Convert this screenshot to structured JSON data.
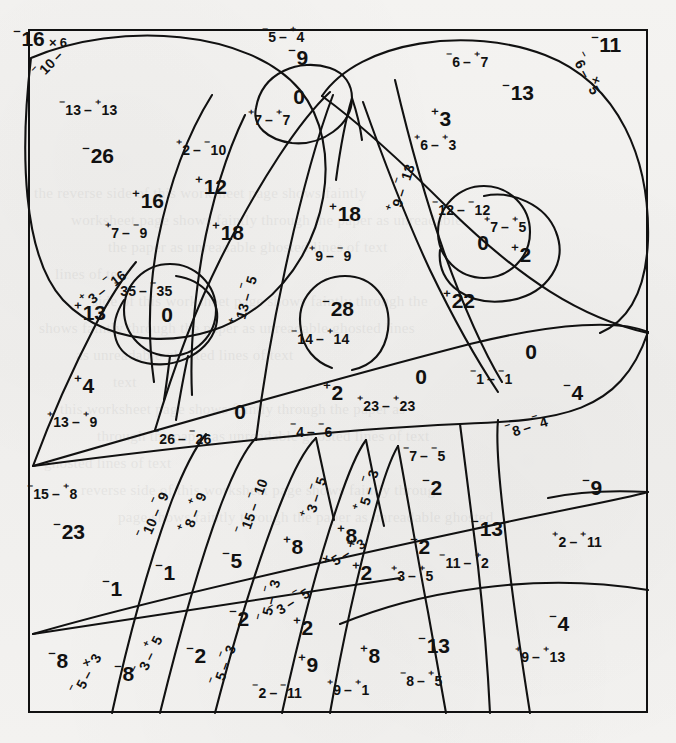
{
  "document": {
    "type": "integer-arithmetic-color-by-number-worksheet",
    "width": 676,
    "height": 743,
    "ink_color": "#111111",
    "paper_color": "#f2f1ef"
  },
  "notation": {
    "raised_minus": "⁻",
    "raised_plus": "⁺",
    "operator_subtract": "–",
    "operator_multiply": "×",
    "description": "Raised-sign integer notation: a small raised + or - precedes each numeral."
  },
  "regions": [
    {
      "id": "r01",
      "answer_sign": "-",
      "answer": "16",
      "answer_suffix": "× 6",
      "expr_a_sign": "-",
      "expr_a": "10",
      "op": "–",
      "expr_b_sign": "",
      "expr_b": "",
      "x": 40,
      "y": 38,
      "ex": 48,
      "ey": 62,
      "rot": -46
    },
    {
      "id": "r02",
      "answer_sign": "-",
      "answer": "26",
      "answer_suffix": "",
      "expr_a_sign": "-",
      "expr_a": "13",
      "op": "–",
      "expr_b_sign": "+",
      "expr_b": "13",
      "x": 98,
      "y": 155,
      "ex": 88,
      "ey": 108,
      "rot": 0
    },
    {
      "id": "r03",
      "answer_sign": "+",
      "answer": "16",
      "answer_suffix": "",
      "expr_a_sign": "+",
      "expr_a": "7",
      "op": "–",
      "expr_b_sign": "-",
      "expr_b": "9",
      "x": 148,
      "y": 200,
      "ex": 126,
      "ey": 231,
      "rot": 0
    },
    {
      "id": "r04",
      "answer_sign": "+",
      "answer": "12",
      "answer_suffix": "",
      "expr_a_sign": "+",
      "expr_a": "2",
      "op": "–",
      "expr_b_sign": "-",
      "expr_b": "10",
      "x": 211,
      "y": 186,
      "ex": 201,
      "ey": 148,
      "rot": 0
    },
    {
      "id": "r05",
      "answer_sign": "-",
      "answer": "9",
      "answer_suffix": "",
      "expr_a_sign": "-",
      "expr_a": "5",
      "op": "–",
      "expr_b_sign": "+",
      "expr_b": "4",
      "x": 298,
      "y": 57,
      "ex": 283,
      "ey": 35,
      "rot": 0
    },
    {
      "id": "r06",
      "answer_sign": "",
      "answer": "0",
      "answer_suffix": "",
      "expr_a_sign": "+",
      "expr_a": "7",
      "op": "–",
      "expr_b_sign": "+",
      "expr_b": "7",
      "x": 299,
      "y": 97,
      "ex": 269,
      "ey": 118,
      "rot": 0
    },
    {
      "id": "r07",
      "answer_sign": "-",
      "answer": "11",
      "answer_suffix": "",
      "expr_a_sign": "-",
      "expr_a": "6",
      "op": "–",
      "expr_b_sign": "×",
      "expr_b": "5",
      "x": 606,
      "y": 44,
      "ex": 588,
      "ey": 73,
      "rot": 62
    },
    {
      "id": "r08",
      "answer_sign": "-",
      "answer": "13",
      "answer_suffix": "",
      "expr_a_sign": "-",
      "expr_a": "6",
      "op": "–",
      "expr_b_sign": "+",
      "expr_b": "7",
      "x": 518,
      "y": 92,
      "ex": 467,
      "ey": 60,
      "rot": 0
    },
    {
      "id": "r09",
      "answer_sign": "+",
      "answer": "3",
      "answer_suffix": "",
      "expr_a_sign": "+",
      "expr_a": "6",
      "op": "–",
      "expr_b_sign": "+",
      "expr_b": "3",
      "x": 441,
      "y": 118,
      "ex": 435,
      "ey": 143,
      "rot": 0
    },
    {
      "id": "r10",
      "answer_sign": "+",
      "answer": "18",
      "answer_suffix": "",
      "expr_a_sign": "+",
      "expr_a": "9",
      "op": "–",
      "expr_b_sign": "-",
      "expr_b": "9",
      "x": 345,
      "y": 213,
      "ex": 330,
      "ey": 254,
      "rot": 0
    },
    {
      "id": "r11",
      "answer_sign": "+",
      "answer": "18",
      "answer_suffix": "",
      "expr_a_sign": "+",
      "expr_a": "13",
      "op": "–",
      "expr_b_sign": "-",
      "expr_b": "5",
      "x": 228,
      "y": 232,
      "ex": 243,
      "ey": 300,
      "rot": -74
    },
    {
      "id": "r12",
      "answer_sign": "",
      "answer": "0",
      "answer_suffix": "",
      "expr_a_sign": "-",
      "expr_a": "12",
      "op": "–",
      "expr_b_sign": "-",
      "expr_b": "12",
      "x": 483,
      "y": 243,
      "ex": 461,
      "ey": 208,
      "rot": 0
    },
    {
      "id": "r13",
      "answer_sign": "+",
      "answer": "2",
      "answer_suffix": "",
      "expr_a_sign": "+",
      "expr_a": "7",
      "op": "–",
      "expr_b_sign": "+",
      "expr_b": "5",
      "x": 521,
      "y": 254,
      "ex": 505,
      "ey": 225,
      "rot": 0
    },
    {
      "id": "r14",
      "answer_sign": "+",
      "answer": "22",
      "answer_suffix": "",
      "expr_a_sign": "+",
      "expr_a": "9",
      "op": "–",
      "expr_b_sign": "-",
      "expr_b": "13",
      "x": 459,
      "y": 300,
      "ex": 400,
      "ey": 188,
      "rot": -72
    },
    {
      "id": "r15",
      "answer_sign": "+",
      "answer": "13",
      "answer_suffix": "",
      "expr_a_sign": "+",
      "expr_a": "3",
      "op": "–",
      "expr_b_sign": "-",
      "expr_b": "16",
      "x": 90,
      "y": 312,
      "ex": 103,
      "ey": 287,
      "rot": -38
    },
    {
      "id": "r16",
      "answer_sign": "",
      "answer": "0",
      "answer_suffix": "",
      "expr_a_sign": "-",
      "expr_a": "35",
      "op": "–",
      "expr_b_sign": "-",
      "expr_b": "35",
      "x": 167,
      "y": 315,
      "ex": 143,
      "ey": 289,
      "rot": 0
    },
    {
      "id": "r17",
      "answer_sign": "-",
      "answer": "28",
      "answer_suffix": "",
      "expr_a_sign": "-",
      "expr_a": "14",
      "op": "–",
      "expr_b_sign": "+",
      "expr_b": "14",
      "x": 338,
      "y": 308,
      "ex": 320,
      "ey": 337,
      "rot": 0
    },
    {
      "id": "r18",
      "answer_sign": "+",
      "answer": "4",
      "answer_suffix": "",
      "expr_a_sign": "+",
      "expr_a": "13",
      "op": "–",
      "expr_b_sign": "+",
      "expr_b": "9",
      "x": 84,
      "y": 385,
      "ex": 72,
      "ey": 420,
      "rot": 0
    },
    {
      "id": "r19",
      "answer_sign": "",
      "answer": "0",
      "answer_suffix": "",
      "expr_a_sign": "-",
      "expr_a": "26",
      "op": "–",
      "expr_b_sign": "-",
      "expr_b": "26",
      "x": 240,
      "y": 412,
      "ex": 182,
      "ey": 437,
      "rot": 0
    },
    {
      "id": "r20",
      "answer_sign": "+",
      "answer": "2",
      "answer_suffix": "",
      "expr_a_sign": "-",
      "expr_a": "4",
      "op": "–",
      "expr_b_sign": "-",
      "expr_b": "6",
      "x": 333,
      "y": 392,
      "ex": 311,
      "ey": 430,
      "rot": 0
    },
    {
      "id": "r21",
      "answer_sign": "",
      "answer": "0",
      "answer_suffix": "",
      "expr_a_sign": "+",
      "expr_a": "23",
      "op": "–",
      "expr_b_sign": "+",
      "expr_b": "23",
      "x": 421,
      "y": 377,
      "ex": 386,
      "ey": 404,
      "rot": 0
    },
    {
      "id": "r22",
      "answer_sign": "",
      "answer": "0",
      "answer_suffix": "",
      "expr_a_sign": "-",
      "expr_a": "1",
      "op": "–",
      "expr_b_sign": "-",
      "expr_b": "1",
      "x": 531,
      "y": 352,
      "ex": 491,
      "ey": 377,
      "rot": 0
    },
    {
      "id": "r23",
      "answer_sign": "-",
      "answer": "4",
      "answer_suffix": "",
      "expr_a_sign": "-",
      "expr_a": "8",
      "op": "–",
      "expr_b_sign": "-",
      "expr_b": "4",
      "x": 573,
      "y": 392,
      "ex": 526,
      "ey": 425,
      "rot": -17
    },
    {
      "id": "r24",
      "answer_sign": "-",
      "answer": "2",
      "answer_suffix": "",
      "expr_a_sign": "-",
      "expr_a": "7",
      "op": "–",
      "expr_b_sign": "-",
      "expr_b": "5",
      "x": 432,
      "y": 487,
      "ex": 424,
      "ey": 454,
      "rot": 0
    },
    {
      "id": "r25",
      "answer_sign": "-",
      "answer": "9",
      "answer_suffix": "",
      "expr_a_sign": "+",
      "expr_a": "2",
      "op": "–",
      "expr_b_sign": "+",
      "expr_b": "11",
      "x": 592,
      "y": 487,
      "ex": 577,
      "ey": 540,
      "rot": 0
    },
    {
      "id": "r26",
      "answer_sign": "-",
      "answer": "23",
      "answer_suffix": "",
      "expr_a_sign": "-",
      "expr_a": "15",
      "op": "–",
      "expr_b_sign": "+",
      "expr_b": "8",
      "x": 69,
      "y": 531,
      "ex": 52,
      "ey": 492,
      "rot": 0
    },
    {
      "id": "r27",
      "answer_sign": "-",
      "answer": "1",
      "answer_suffix": "",
      "expr_a_sign": "-",
      "expr_a": "10",
      "op": "–",
      "expr_b_sign": "-",
      "expr_b": "9",
      "x": 112,
      "y": 588,
      "ex": 152,
      "ey": 515,
      "rot": -66
    },
    {
      "id": "r28",
      "answer_sign": "-",
      "answer": "1",
      "answer_suffix": "",
      "expr_a_sign": "+",
      "expr_a": "8",
      "op": "–",
      "expr_b_sign": "+",
      "expr_b": "9",
      "x": 165,
      "y": 572,
      "ex": 192,
      "ey": 512,
      "rot": -68
    },
    {
      "id": "r29",
      "answer_sign": "-",
      "answer": "5",
      "answer_suffix": "",
      "expr_a_sign": "-",
      "expr_a": "15",
      "op": "–",
      "expr_b_sign": "-",
      "expr_b": "10",
      "x": 232,
      "y": 560,
      "ex": 251,
      "ey": 506,
      "rot": -70
    },
    {
      "id": "r30",
      "answer_sign": "+",
      "answer": "8",
      "answer_suffix": "",
      "expr_a_sign": "+",
      "expr_a": "3",
      "op": "–",
      "expr_b_sign": "-",
      "expr_b": "5",
      "x": 293,
      "y": 546,
      "ex": 313,
      "ey": 497,
      "rot": -72
    },
    {
      "id": "r31",
      "answer_sign": "+",
      "answer": "8",
      "answer_suffix": "",
      "expr_a_sign": "+",
      "expr_a": "5",
      "op": "–",
      "expr_b_sign": "-",
      "expr_b": "3",
      "x": 347,
      "y": 535,
      "ex": 366,
      "ey": 490,
      "rot": -74
    },
    {
      "id": "r32",
      "answer_sign": "-",
      "answer": "2",
      "answer_suffix": "",
      "expr_a_sign": "+",
      "expr_a": "3",
      "op": "–",
      "expr_b_sign": "+",
      "expr_b": "5",
      "x": 420,
      "y": 546,
      "ex": 412,
      "ey": 574,
      "rot": 0
    },
    {
      "id": "r33",
      "answer_sign": "-",
      "answer": "13",
      "answer_suffix": "",
      "expr_a_sign": "-",
      "expr_a": "11",
      "op": "–",
      "expr_b_sign": "+",
      "expr_b": "2",
      "x": 487,
      "y": 528,
      "ex": 464,
      "ey": 561,
      "rot": 0
    },
    {
      "id": "r34",
      "answer_sign": "+",
      "answer": "2",
      "answer_suffix": "",
      "expr_a_sign": "×",
      "expr_a": "5",
      "op": "–",
      "expr_b_sign": "×",
      "expr_b": "3",
      "x": 362,
      "y": 572,
      "ex": 344,
      "ey": 552,
      "rot": -32
    },
    {
      "id": "r35",
      "answer_sign": "+",
      "answer": "2",
      "answer_suffix": "",
      "expr_a_sign": "-",
      "expr_a": "3",
      "op": "–",
      "expr_b_sign": "-",
      "expr_b": "5",
      "x": 303,
      "y": 627,
      "ex": 289,
      "ey": 601,
      "rot": -32
    },
    {
      "id": "r36",
      "answer_sign": "-",
      "answer": "8",
      "answer_suffix": "",
      "expr_a_sign": "-",
      "expr_a": "5",
      "op": "–",
      "expr_b_sign": "×",
      "expr_b": "3",
      "x": 58,
      "y": 660,
      "ex": 85,
      "ey": 673,
      "rot": -62
    },
    {
      "id": "r37",
      "answer_sign": "-",
      "answer": "8",
      "answer_suffix": "",
      "expr_a_sign": "-",
      "expr_a": "3",
      "op": "–",
      "expr_b_sign": "+",
      "expr_b": "5",
      "x": 124,
      "y": 673,
      "ex": 147,
      "ey": 655,
      "rot": -64
    },
    {
      "id": "r38",
      "answer_sign": "-",
      "answer": "2",
      "answer_suffix": "",
      "expr_a_sign": "-",
      "expr_a": "5",
      "op": "–",
      "expr_b_sign": "-",
      "expr_b": "3",
      "x": 196,
      "y": 655,
      "ex": 222,
      "ey": 665,
      "rot": -70
    },
    {
      "id": "r39",
      "answer_sign": "-",
      "answer": "2",
      "answer_suffix": "",
      "expr_a_sign": "-",
      "expr_a": "5",
      "op": "–",
      "expr_b_sign": "-",
      "expr_b": "3",
      "x": 239,
      "y": 618,
      "ex": 268,
      "ey": 600,
      "rot": -76
    },
    {
      "id": "r40",
      "answer_sign": "+",
      "answer": "9",
      "answer_suffix": "",
      "expr_a_sign": "-",
      "expr_a": "2",
      "op": "–",
      "expr_b_sign": "-",
      "expr_b": "11",
      "x": 308,
      "y": 664,
      "ex": 277,
      "ey": 691,
      "rot": 0
    },
    {
      "id": "r41",
      "answer_sign": "+",
      "answer": "8",
      "answer_suffix": "",
      "expr_a_sign": "+",
      "expr_a": "9",
      "op": "–",
      "expr_b_sign": "+",
      "expr_b": "1",
      "x": 370,
      "y": 655,
      "ex": 348,
      "ey": 688,
      "rot": 0
    },
    {
      "id": "r42",
      "answer_sign": "-",
      "answer": "13",
      "answer_suffix": "",
      "expr_a_sign": "-",
      "expr_a": "8",
      "op": "–",
      "expr_b_sign": "+",
      "expr_b": "5",
      "x": 434,
      "y": 645,
      "ex": 421,
      "ey": 679,
      "rot": 0
    },
    {
      "id": "r43",
      "answer_sign": "-",
      "answer": "4",
      "answer_suffix": "",
      "expr_a_sign": "+",
      "expr_a": "9",
      "op": "–",
      "expr_b_sign": "+",
      "expr_b": "13",
      "x": 559,
      "y": 623,
      "ex": 540,
      "ey": 655,
      "rot": 0
    }
  ],
  "bleed_through_text": "the reverse side of this worksheet page shows faintly through the paper as unreadable ghosted lines of text"
}
